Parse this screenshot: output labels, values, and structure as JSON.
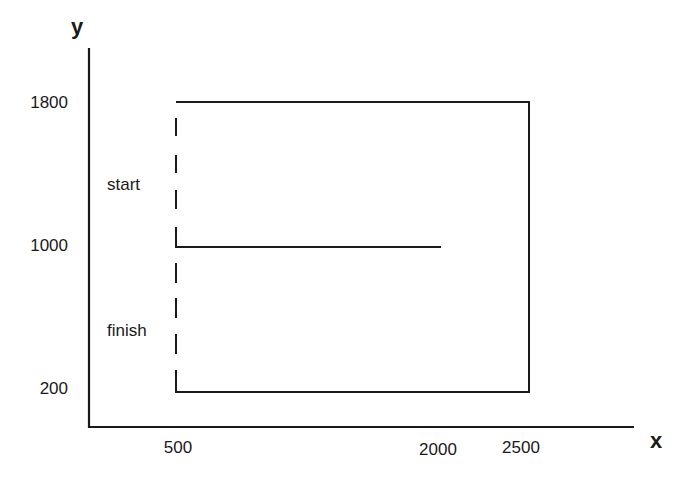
{
  "diagram": {
    "axes": {
      "x_label": "x",
      "y_label": "y"
    },
    "y_ticks": [
      {
        "label": "1800",
        "value": 1800
      },
      {
        "label": "1000",
        "value": 1000
      },
      {
        "label": "200",
        "value": 200
      }
    ],
    "x_ticks": [
      {
        "label": "500",
        "value": 500
      },
      {
        "label": "2000",
        "value": 2000
      },
      {
        "label": "2500",
        "value": 2500
      }
    ],
    "annotations": {
      "start": "start",
      "finish": "finish"
    },
    "path": {
      "description": "Outer rectangle open on the left side (dashed), with a horizontal line at y=1000 from x=500 to x=2000",
      "solid_segments": [
        {
          "from": [
            500,
            1800
          ],
          "to": [
            2500,
            1800
          ]
        },
        {
          "from": [
            2500,
            1800
          ],
          "to": [
            2500,
            200
          ]
        },
        {
          "from": [
            2500,
            200
          ],
          "to": [
            500,
            200
          ]
        },
        {
          "from": [
            500,
            1000
          ],
          "to": [
            2000,
            1000
          ]
        }
      ],
      "dashed_segments": [
        {
          "from": [
            500,
            1800
          ],
          "to": [
            500,
            200
          ]
        }
      ]
    },
    "stroke_color": "#1a1a1a"
  }
}
